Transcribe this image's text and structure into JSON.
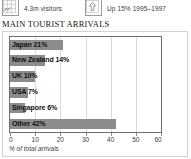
{
  "header": {
    "stats": [
      {
        "icon": "map-grid-icon",
        "text": "4.3m visitors"
      },
      {
        "icon": "up-arrow-icon",
        "text": "Up 15% 1995–1997"
      }
    ]
  },
  "chart_title": "MAIN TOURIST ARRIVALS",
  "colors": {
    "bar": "#8c8c8c",
    "plot_border": "#6e6e6e",
    "gridline": "#d9d9d9",
    "outer_border": "#d2d2d2"
  },
  "chart_data": {
    "type": "bar",
    "orientation": "horizontal",
    "title": "MAIN TOURIST ARRIVALS",
    "categories": [
      "Japan",
      "New Zealand",
      "UK",
      "USA",
      "Singapore",
      "Other"
    ],
    "values": [
      21,
      14,
      10,
      7,
      6,
      42
    ],
    "bar_labels": [
      "Japan 21%",
      "New Zealand 14%",
      "UK 10%",
      "USA 7%",
      "Singapore 6%",
      "Other 42%"
    ],
    "xlabel": "% of total arrivals",
    "ylabel": "",
    "xlim": [
      0,
      60
    ],
    "xticks": [
      0,
      10,
      20,
      30,
      40,
      50,
      60
    ],
    "xtick_labels": [
      "0",
      "10",
      "20",
      "30",
      "40",
      "50",
      "60"
    ],
    "grid": "vertical",
    "legend": "none"
  }
}
